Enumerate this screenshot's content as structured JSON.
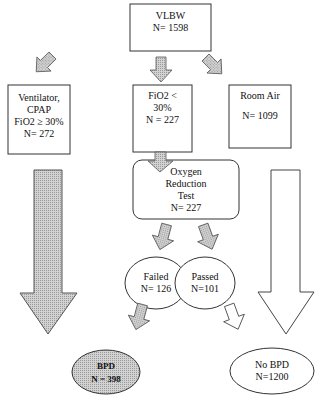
{
  "diagram": {
    "type": "flowchart",
    "colors": {
      "stroke": "#333333",
      "fill_gray": "#c8c8c8",
      "background": "#ffffff"
    },
    "nodes": {
      "root": {
        "title": "VLBW",
        "count": "N= 1598"
      },
      "ventilator": {
        "line1": "Ventilator,",
        "line2": "CPAP",
        "line3": "FiO2 ≥ 30%",
        "count": "N= 272"
      },
      "fio2_low": {
        "line1": "FiO2 <",
        "line2": "30%",
        "count": "N = 227"
      },
      "room_air": {
        "title": "Room Air",
        "count": "N= 1099"
      },
      "oxygen_test": {
        "line1": "Oxygen",
        "line2": "Reduction",
        "line3": "Test",
        "count": "N= 227"
      },
      "failed": {
        "title": "Failed",
        "count": "N= 126"
      },
      "passed": {
        "title": "Passed",
        "count": "N=101"
      },
      "bpd": {
        "title": "BPD",
        "count": "N = 398"
      },
      "no_bpd": {
        "title": "No BPD",
        "count": "N=1200"
      }
    },
    "edges": [
      {
        "from": "root",
        "to": "ventilator",
        "style": "gray-arrow"
      },
      {
        "from": "root",
        "to": "fio2_low",
        "style": "gray-arrow"
      },
      {
        "from": "root",
        "to": "room_air",
        "style": "gray-arrow"
      },
      {
        "from": "fio2_low",
        "to": "oxygen_test",
        "style": "gray-arrow"
      },
      {
        "from": "oxygen_test",
        "to": "failed",
        "style": "gray-arrow"
      },
      {
        "from": "oxygen_test",
        "to": "passed",
        "style": "gray-arrow"
      },
      {
        "from": "failed",
        "to": "bpd",
        "style": "gray-arrow"
      },
      {
        "from": "passed",
        "to": "no_bpd",
        "style": "white-arrow"
      },
      {
        "from": "ventilator",
        "to": "bpd",
        "style": "large-gray-arrow"
      },
      {
        "from": "room_air",
        "to": "no_bpd",
        "style": "large-white-arrow"
      }
    ]
  }
}
